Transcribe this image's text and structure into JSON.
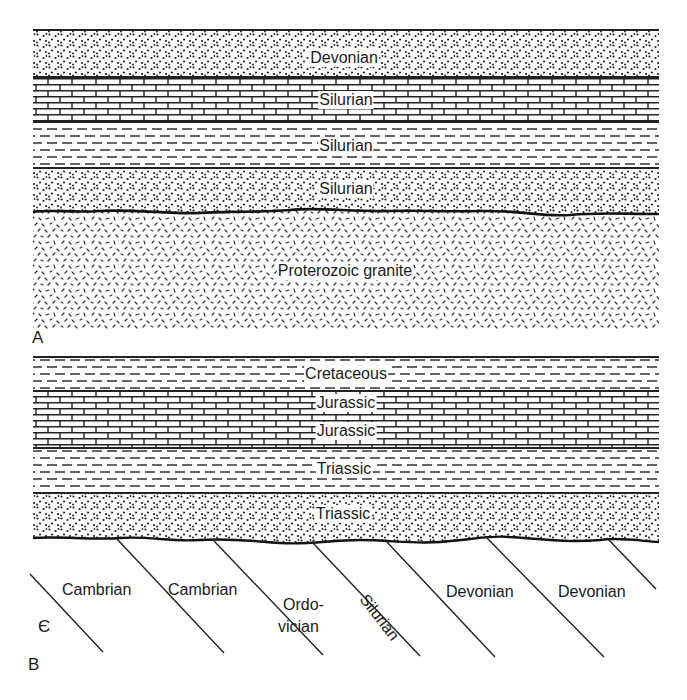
{
  "figure": {
    "panels": [
      {
        "id": "A",
        "letter": "A",
        "description": "Disconformity/nonconformity: sedimentary layers resting on eroded Proterozoic granite",
        "layers": [
          {
            "label": "Devonian",
            "lithology": "sandstone"
          },
          {
            "label": "Silurian",
            "lithology": "limestone"
          },
          {
            "label": "Silurian",
            "lithology": "shale"
          },
          {
            "label": "Silurian",
            "lithology": "sandstone"
          },
          {
            "label": "Proterozoic granite",
            "lithology": "granite"
          }
        ]
      },
      {
        "id": "B",
        "letter": "B",
        "description": "Angular unconformity: horizontal Mesozoic layers over tilted Paleozoic strata",
        "layers": [
          {
            "label": "Cretaceous",
            "lithology": "shale"
          },
          {
            "label": "Jurassic",
            "lithology": "limestone"
          },
          {
            "label": "Jurassic",
            "lithology": "limestone"
          },
          {
            "label": "Triassic",
            "lithology": "shale"
          },
          {
            "label": "Triassic",
            "lithology": "sandstone"
          }
        ],
        "tilted_units": [
          {
            "label": "Є"
          },
          {
            "label": "Cambrian"
          },
          {
            "label": "Cambrian"
          },
          {
            "label": "Ordo-",
            "label2": "vician"
          },
          {
            "label": "Silurian"
          },
          {
            "label": "Devonian"
          },
          {
            "label": "Devonian"
          }
        ]
      }
    ]
  }
}
